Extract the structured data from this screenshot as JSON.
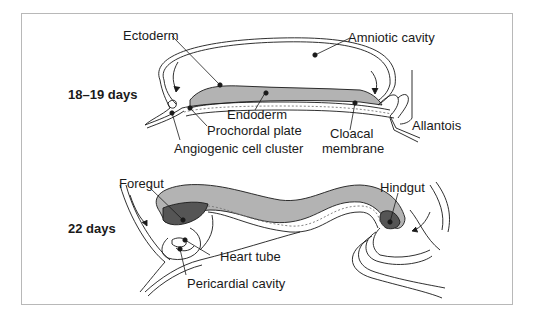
{
  "diagram": {
    "stages": [
      {
        "label": "18–19 days",
        "structures": [
          {
            "name": "Ectoderm"
          },
          {
            "name": "Amniotic cavity"
          },
          {
            "name": "Endoderm"
          },
          {
            "name": "Prochordal plate"
          },
          {
            "name": "Angiogenic cell cluster"
          },
          {
            "name": "Cloacal membrane",
            "lines": [
              "Cloacal",
              "membrane"
            ]
          },
          {
            "name": "Allantois"
          }
        ]
      },
      {
        "label": "22 days",
        "structures": [
          {
            "name": "Foregut"
          },
          {
            "name": "Hindgut"
          },
          {
            "name": "Heart tube"
          },
          {
            "name": "Pericardial cavity"
          }
        ]
      }
    ],
    "colors": {
      "ectoderm_fill": "#b3b3b3",
      "gut_dark_fill": "#555555",
      "line": "#1a1a1a",
      "border": "#b8b8b8"
    }
  }
}
